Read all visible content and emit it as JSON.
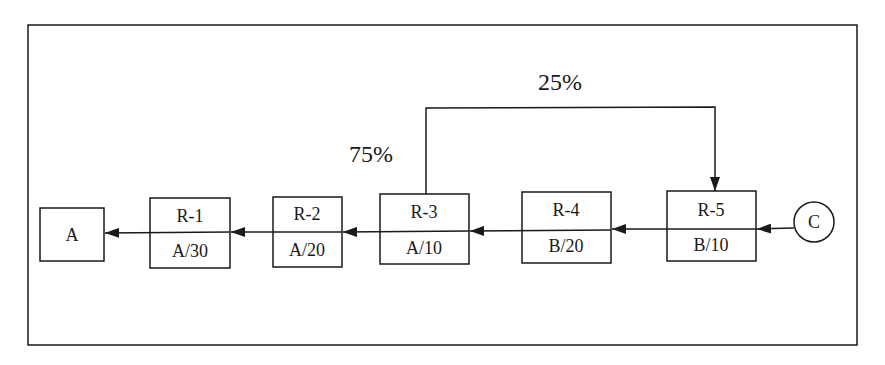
{
  "diagram": {
    "type": "process-flow",
    "colors": {
      "stroke": "#1a1a1a",
      "background": "#ffffff"
    },
    "source": {
      "label": "C",
      "shape": "circle"
    },
    "sink": {
      "label": "A",
      "shape": "box"
    },
    "units": [
      {
        "id": "R-1",
        "top": "R-1",
        "bottom": "A/30"
      },
      {
        "id": "R-2",
        "top": "R-2",
        "bottom": "A/20"
      },
      {
        "id": "R-3",
        "top": "R-3",
        "bottom": "A/10"
      },
      {
        "id": "R-4",
        "top": "R-4",
        "bottom": "B/20"
      },
      {
        "id": "R-5",
        "top": "R-5",
        "bottom": "B/10"
      }
    ],
    "flow_direction": "right-to-left",
    "flow_order": [
      "C",
      "R-5",
      "R-4",
      "R-3",
      "R-2",
      "R-1",
      "A"
    ],
    "recycle": {
      "from": "R-3",
      "to": "R-5",
      "recycle_label": "25%",
      "forward_label": "75%"
    }
  }
}
